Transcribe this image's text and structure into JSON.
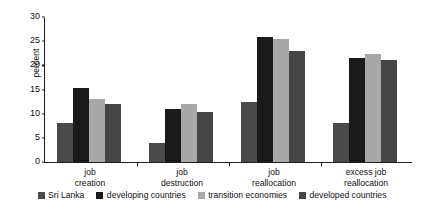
{
  "chart_data": {
    "type": "bar",
    "title": "",
    "subtitle": "",
    "xlabel": "",
    "ylabel": "percent",
    "ylim": [
      0,
      30
    ],
    "yticks": [
      0,
      5,
      10,
      15,
      20,
      25,
      30
    ],
    "grid": false,
    "legend_position": "bottom",
    "categories": [
      "job creation",
      "job destruction",
      "job reallocation",
      "excess job reallocation"
    ],
    "category_lines": [
      [
        "job",
        "creation"
      ],
      [
        "job",
        "destruction"
      ],
      [
        "job",
        "reallocation"
      ],
      [
        "excess job",
        "reallocation"
      ]
    ],
    "series": [
      {
        "name": "Sri Lanka",
        "color": "#4a4a4a",
        "values": [
          8.0,
          3.9,
          12.4,
          8.0
        ]
      },
      {
        "name": "developing countries",
        "color": "#1a1a1a",
        "values": [
          15.4,
          11.0,
          25.8,
          21.6
        ]
      },
      {
        "name": "transition economies",
        "color": "#a8a8a8",
        "values": [
          13.0,
          12.0,
          25.4,
          22.3
        ]
      },
      {
        "name": "developed countries",
        "color": "#454545",
        "values": [
          12.0,
          10.4,
          22.9,
          21.2
        ]
      }
    ]
  }
}
